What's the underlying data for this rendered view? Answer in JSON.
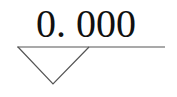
{
  "elevation_marker": {
    "value": "0. 000",
    "line_color": "#555555",
    "text_color": "#111111"
  }
}
